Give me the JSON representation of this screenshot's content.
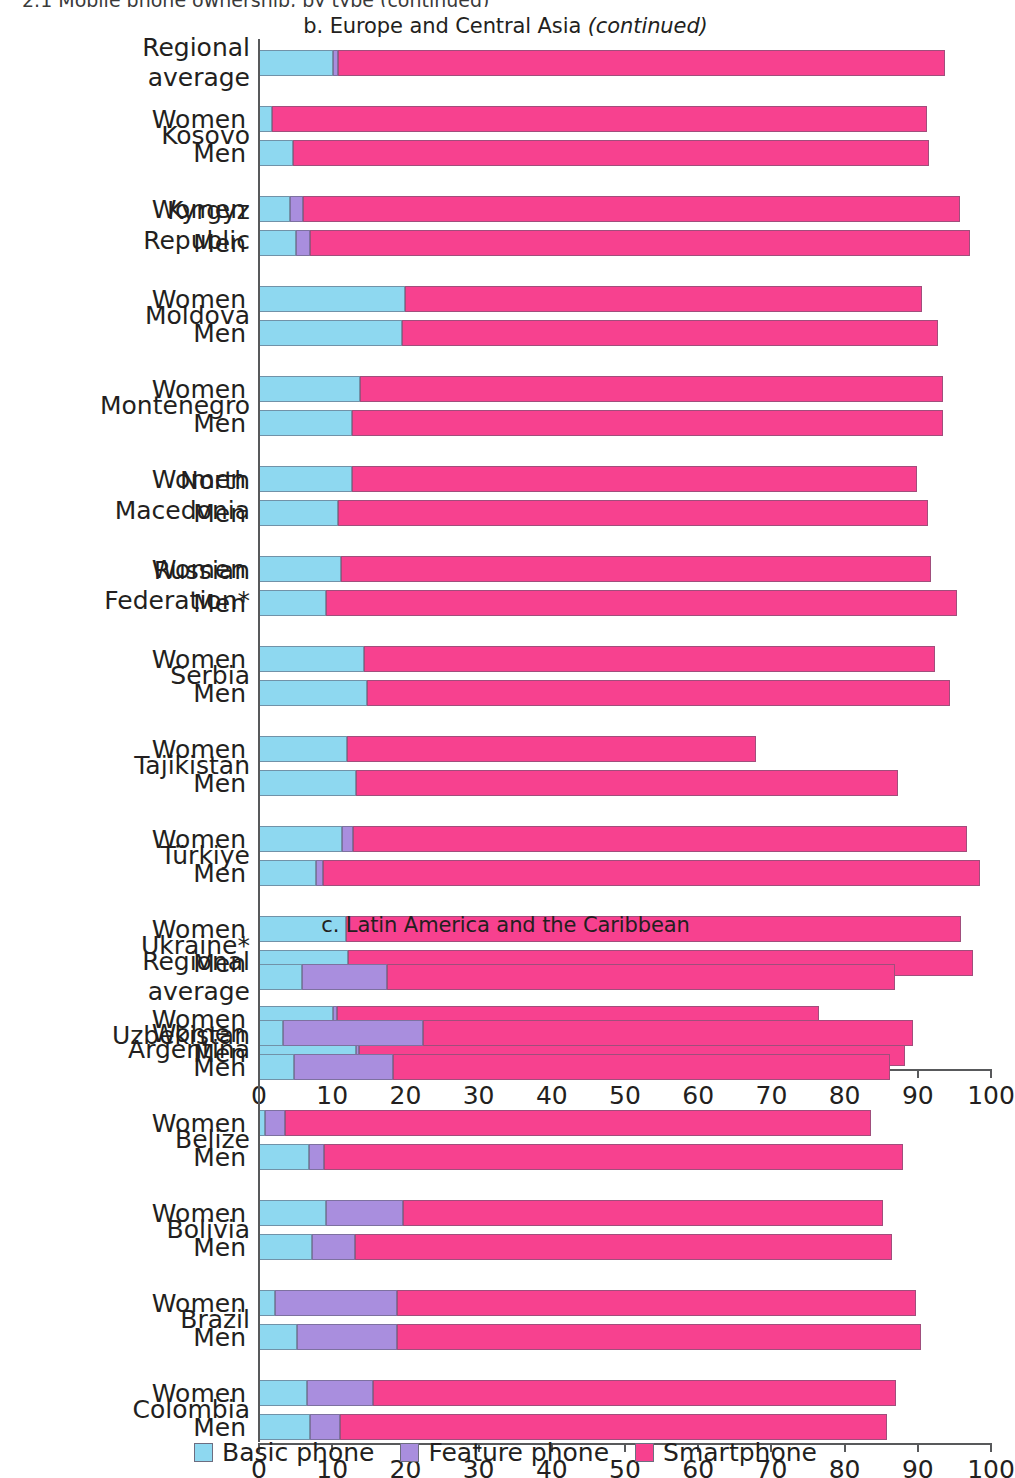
{
  "clipped_top_text": "2.1 Mobile phone ownership, by type (continued)",
  "panels": [
    {
      "id": "b",
      "title_main": "b. Europe and Central Asia ",
      "title_note": "(continued)",
      "axis": {
        "min": 0,
        "max": 100,
        "ticks": [
          0,
          10,
          20,
          30,
          40,
          50,
          60,
          70,
          80,
          90,
          100
        ]
      },
      "groups": [
        {
          "name": "Regional\naverage",
          "rows": [
            {
              "sex": "",
              "basic": 10.2,
              "feature": 0.7,
              "smart": 83.0,
              "total": 93.9
            }
          ]
        },
        {
          "name": "Kosovo",
          "rows": [
            {
              "sex": "Women",
              "basic": 1.9,
              "feature": 0.0,
              "smart": 89.5,
              "total": 91.4
            },
            {
              "sex": "Men",
              "basic": 4.8,
              "feature": 0.0,
              "smart": 86.8,
              "total": 91.6
            }
          ]
        },
        {
          "name": "Kyrgyz\nRepublic",
          "rows": [
            {
              "sex": "Women",
              "basic": 4.4,
              "feature": 1.7,
              "smart": 89.8,
              "total": 95.9
            },
            {
              "sex": "Men",
              "basic": 5.2,
              "feature": 1.9,
              "smart": 90.1,
              "total": 97.2
            }
          ]
        },
        {
          "name": "Moldova",
          "rows": [
            {
              "sex": "Women",
              "basic": 20.1,
              "feature": 0.0,
              "smart": 70.6,
              "total": 90.7
            },
            {
              "sex": "Men",
              "basic": 19.7,
              "feature": 0.0,
              "smart": 73.2,
              "total": 92.9
            }
          ]
        },
        {
          "name": "Montenegro",
          "rows": [
            {
              "sex": "Women",
              "basic": 13.9,
              "feature": 0.0,
              "smart": 79.7,
              "total": 93.6
            },
            {
              "sex": "Men",
              "basic": 12.8,
              "feature": 0.0,
              "smart": 80.8,
              "total": 93.6
            }
          ]
        },
        {
          "name": "North\nMacedonia",
          "rows": [
            {
              "sex": "Women",
              "basic": 12.8,
              "feature": 0.0,
              "smart": 77.2,
              "total": 90.0
            },
            {
              "sex": "Men",
              "basic": 10.9,
              "feature": 0.0,
              "smart": 80.6,
              "total": 91.5
            }
          ]
        },
        {
          "name": "Russian\nFederation*",
          "rows": [
            {
              "sex": "Women",
              "basic": 11.3,
              "feature": 0.0,
              "smart": 80.6,
              "total": 91.9
            },
            {
              "sex": "Men",
              "basic": 9.3,
              "feature": 0.0,
              "smart": 86.2,
              "total": 95.5
            }
          ]
        },
        {
          "name": "Serbia",
          "rows": [
            {
              "sex": "Women",
              "basic": 14.5,
              "feature": 0.0,
              "smart": 78.0,
              "total": 92.5
            },
            {
              "sex": "Men",
              "basic": 14.9,
              "feature": 0.0,
              "smart": 79.6,
              "total": 94.5
            }
          ]
        },
        {
          "name": "Tajikistan",
          "rows": [
            {
              "sex": "Women",
              "basic": 12.2,
              "feature": 0.0,
              "smart": 55.8,
              "total": 68.0
            },
            {
              "sex": "Men",
              "basic": 13.4,
              "feature": 0.0,
              "smart": 74.1,
              "total": 87.5
            }
          ]
        },
        {
          "name": "Türkiye",
          "rows": [
            {
              "sex": "Women",
              "basic": 11.5,
              "feature": 1.5,
              "smart": 83.8,
              "total": 96.8
            },
            {
              "sex": "Men",
              "basic": 7.9,
              "feature": 1.0,
              "smart": 89.8,
              "total": 98.7
            }
          ]
        },
        {
          "name": "Ukraine*",
          "rows": [
            {
              "sex": "Women",
              "basic": 12.0,
              "feature": 0.0,
              "smart": 84.0,
              "total": 96.0
            },
            {
              "sex": "Men",
              "basic": 12.3,
              "feature": 0.0,
              "smart": 85.4,
              "total": 97.7
            }
          ]
        },
        {
          "name": "Uzbekistan",
          "rows": [
            {
              "sex": "Women",
              "basic": 10.2,
              "feature": 0.6,
              "smart": 65.9,
              "total": 76.7
            },
            {
              "sex": "Men",
              "basic": 13.4,
              "feature": 0.4,
              "smart": 74.6,
              "total": 88.4
            }
          ]
        }
      ]
    },
    {
      "id": "c",
      "title_main": "c. Latin America and the Caribbean",
      "title_note": "",
      "axis": {
        "min": 0,
        "max": 100,
        "ticks": [
          0,
          10,
          20,
          30,
          40,
          50,
          60,
          70,
          80,
          90,
          100
        ]
      },
      "groups": [
        {
          "name": "Regional\naverage",
          "rows": [
            {
              "sex": "",
              "basic": 6.0,
              "feature": 11.6,
              "smart": 69.4,
              "total": 87.0
            }
          ]
        },
        {
          "name": "Argentina",
          "rows": [
            {
              "sex": "Women",
              "basic": 3.4,
              "feature": 19.1,
              "smart": 67.0,
              "total": 89.5
            },
            {
              "sex": "Men",
              "basic": 4.9,
              "feature": 13.5,
              "smart": 67.9,
              "total": 86.3
            }
          ]
        },
        {
          "name": "Belize",
          "rows": [
            {
              "sex": "Women",
              "basic": 1.0,
              "feature": 2.7,
              "smart": 80.0,
              "total": 83.7
            },
            {
              "sex": "Men",
              "basic": 7.0,
              "feature": 2.0,
              "smart": 79.1,
              "total": 88.1
            }
          ]
        },
        {
          "name": "Bolivia",
          "rows": [
            {
              "sex": "Women",
              "basic": 9.3,
              "feature": 10.5,
              "smart": 65.6,
              "total": 85.4
            },
            {
              "sex": "Men",
              "basic": 7.4,
              "feature": 5.9,
              "smart": 73.3,
              "total": 86.6
            }
          ]
        },
        {
          "name": "Brazil",
          "rows": [
            {
              "sex": "Women",
              "basic": 2.3,
              "feature": 16.7,
              "smart": 70.9,
              "total": 89.9
            },
            {
              "sex": "Men",
              "basic": 5.3,
              "feature": 13.7,
              "smart": 71.6,
              "total": 90.6
            }
          ]
        },
        {
          "name": "Colombia",
          "rows": [
            {
              "sex": "Women",
              "basic": 6.7,
              "feature": 9.0,
              "smart": 71.5,
              "total": 87.2
            },
            {
              "sex": "Men",
              "basic": 7.1,
              "feature": 4.1,
              "smart": 74.7,
              "total": 85.9
            }
          ]
        }
      ]
    }
  ],
  "legend": {
    "items": [
      {
        "label": "Basic phone",
        "color": "#8ed8f0"
      },
      {
        "label": "Feature phone",
        "color": "#a98ede"
      },
      {
        "label": "Smartphone",
        "color": "#f7418f"
      }
    ]
  },
  "chart_data": {
    "type": "bar",
    "orientation": "horizontal",
    "stacked": true,
    "xlabel": "",
    "ylabel": "",
    "xlim": [
      0,
      100
    ],
    "xticks": [
      0,
      10,
      20,
      30,
      40,
      50,
      60,
      70,
      80,
      90,
      100
    ],
    "grid": false,
    "legend_position": "bottom-center",
    "legend_entries": [
      "Basic phone",
      "Feature phone",
      "Smartphone"
    ],
    "series_colors": {
      "Basic phone": "#8ed8f0",
      "Feature phone": "#a98ede",
      "Smartphone": "#f7418f"
    },
    "panels": [
      {
        "panel": "b. Europe and Central Asia (continued)",
        "categories": [
          "Regional average",
          "Kosovo – Women",
          "Kosovo – Men",
          "Kyrgyz Republic – Women",
          "Kyrgyz Republic – Men",
          "Moldova – Women",
          "Moldova – Men",
          "Montenegro – Women",
          "Montenegro – Men",
          "North Macedonia – Women",
          "North Macedonia – Men",
          "Russian Federation* – Women",
          "Russian Federation* – Men",
          "Serbia – Women",
          "Serbia – Men",
          "Tajikistan – Women",
          "Tajikistan – Men",
          "Türkiye – Women",
          "Türkiye – Men",
          "Ukraine* – Women",
          "Ukraine* – Men",
          "Uzbekistan – Women",
          "Uzbekistan – Men"
        ],
        "series": [
          {
            "name": "Basic phone",
            "values": [
              10.2,
              1.9,
              4.8,
              4.4,
              5.2,
              20.1,
              19.7,
              13.9,
              12.8,
              12.8,
              10.9,
              11.3,
              9.3,
              14.5,
              14.9,
              12.2,
              13.4,
              11.5,
              7.9,
              12.0,
              12.3,
              10.2,
              13.4
            ]
          },
          {
            "name": "Feature phone",
            "values": [
              0.7,
              0.0,
              0.0,
              1.7,
              1.9,
              0.0,
              0.0,
              0.0,
              0.0,
              0.0,
              0.0,
              0.0,
              0.0,
              0.0,
              0.0,
              0.0,
              0.0,
              1.5,
              1.0,
              0.0,
              0.0,
              0.6,
              0.4
            ]
          },
          {
            "name": "Smartphone",
            "values": [
              83.0,
              89.5,
              86.8,
              89.8,
              90.1,
              70.6,
              73.2,
              79.7,
              80.8,
              77.2,
              80.6,
              80.6,
              86.2,
              78.0,
              79.6,
              55.8,
              74.1,
              83.8,
              89.8,
              84.0,
              85.4,
              65.9,
              74.6
            ]
          }
        ],
        "totals": [
          93.9,
          91.4,
          91.6,
          95.9,
          97.2,
          90.7,
          92.9,
          93.6,
          93.6,
          90.0,
          91.5,
          91.9,
          95.5,
          92.5,
          94.5,
          68.0,
          87.5,
          96.8,
          98.7,
          96.0,
          97.7,
          76.7,
          88.4
        ]
      },
      {
        "panel": "c. Latin America and the Caribbean",
        "categories": [
          "Regional average",
          "Argentina – Women",
          "Argentina – Men",
          "Belize – Women",
          "Belize – Men",
          "Bolivia – Women",
          "Bolivia – Men",
          "Brazil – Women",
          "Brazil – Men",
          "Colombia – Women",
          "Colombia – Men"
        ],
        "series": [
          {
            "name": "Basic phone",
            "values": [
              6.0,
              3.4,
              4.9,
              1.0,
              7.0,
              9.3,
              7.4,
              2.3,
              5.3,
              6.7,
              7.1
            ]
          },
          {
            "name": "Feature phone",
            "values": [
              11.6,
              19.1,
              13.5,
              2.7,
              2.0,
              10.5,
              5.9,
              16.7,
              13.7,
              9.0,
              4.1
            ]
          },
          {
            "name": "Smartphone",
            "values": [
              69.4,
              67.0,
              67.9,
              80.0,
              79.1,
              65.6,
              73.3,
              70.9,
              71.6,
              71.5,
              74.7
            ]
          }
        ],
        "totals": [
          87.0,
          89.5,
          86.3,
          83.7,
          88.1,
          85.4,
          86.6,
          89.9,
          90.6,
          87.2,
          85.9
        ]
      }
    ]
  }
}
